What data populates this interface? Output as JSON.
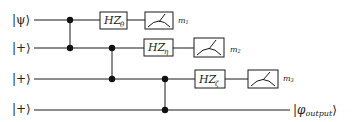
{
  "diagram": {
    "type": "quantum-circuit",
    "qubits": [
      {
        "label": "|ψ⟩",
        "input": "ψ"
      },
      {
        "label": "|+⟩",
        "input": "+"
      },
      {
        "label": "|+⟩",
        "input": "+"
      },
      {
        "label": "|+⟩",
        "input": "+"
      }
    ],
    "cz_gates": [
      {
        "control": 1,
        "target": 2
      },
      {
        "control": 2,
        "target": 3
      },
      {
        "control": 3,
        "target": 4
      }
    ],
    "rotation_gates": [
      {
        "qubit": 1,
        "label": "HZ",
        "subscript": "θ"
      },
      {
        "qubit": 2,
        "label": "HZ",
        "subscript": "η"
      },
      {
        "qubit": 3,
        "label": "HZ",
        "subscript": "ζ"
      }
    ],
    "measurements": [
      {
        "qubit": 1,
        "label": "m",
        "subscript": "1"
      },
      {
        "qubit": 2,
        "label": "m",
        "subscript": "2"
      },
      {
        "qubit": 3,
        "label": "m",
        "subscript": "3"
      }
    ],
    "output": {
      "qubit": 4,
      "label": "|φ",
      "subscript": "output",
      "close": "⟩"
    }
  }
}
